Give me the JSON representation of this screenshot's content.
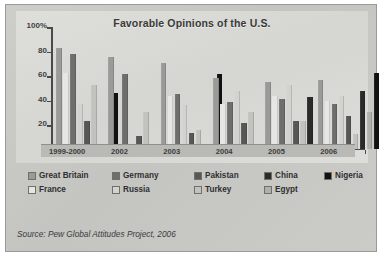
{
  "source_note": "Source: Pew Global Attitudes Project, 2006",
  "legend": {
    "rows": [
      [
        {
          "label": "Great Britain",
          "color": "#9a9a98"
        },
        {
          "label": "Germany",
          "color": "#6e6e6c"
        },
        {
          "label": "Pakistan",
          "color": "#575755"
        },
        {
          "label": "China",
          "color": "#2b2b2a"
        },
        {
          "label": "Nigeria",
          "color": "#121212"
        }
      ],
      [
        {
          "label": "France",
          "color": "#e6e6e2"
        },
        {
          "label": "Russia",
          "color": "#d2d2ce"
        },
        {
          "label": "Turkey",
          "color": "#c2c2be"
        },
        {
          "label": "Egypt",
          "color": "#b0b0ac"
        }
      ]
    ]
  },
  "chart_data": {
    "type": "bar",
    "title": "Favorable Opinions of the U.S.",
    "xlabel": "",
    "ylabel": "",
    "ylim": [
      0,
      100
    ],
    "yticks": [
      "0",
      "20",
      "40",
      "60",
      "80",
      "100%"
    ],
    "grid": false,
    "legend_position": "below-axes",
    "units": "percent",
    "categories": [
      "1999-2000",
      "2002",
      "2003",
      "2004",
      "2005",
      "2006"
    ],
    "series": [
      {
        "name": "Great Britain",
        "color": "#9a9a98",
        "values": [
          83,
          75,
          70,
          58,
          55,
          56
        ]
      },
      {
        "name": "France",
        "color": "#e6e6e2",
        "values": [
          62,
          0,
          43,
          37,
          43,
          39
        ]
      },
      {
        "name": "Germany",
        "color": "#6e6e6c",
        "values": [
          78,
          61,
          45,
          38,
          41,
          37
        ]
      },
      {
        "name": "Russia",
        "color": "#d2d2ce",
        "values": [
          37,
          0,
          36,
          47,
          52,
          43
        ]
      },
      {
        "name": "Pakistan",
        "color": "#575755",
        "values": [
          23,
          10,
          13,
          21,
          23,
          27
        ]
      },
      {
        "name": "Turkey",
        "color": "#c2c2be",
        "values": [
          52,
          30,
          15,
          30,
          23,
          12
        ]
      },
      {
        "name": "China",
        "color": "#2b2b2a",
        "values": [
          0,
          0,
          0,
          0,
          42,
          47
        ]
      },
      {
        "name": "Egypt",
        "color": "#b0b0ac",
        "values": [
          0,
          0,
          0,
          0,
          0,
          30
        ]
      },
      {
        "name": "Nigeria",
        "color": "#121212",
        "values": [
          46,
          0,
          61,
          0,
          0,
          62
        ]
      }
    ]
  }
}
